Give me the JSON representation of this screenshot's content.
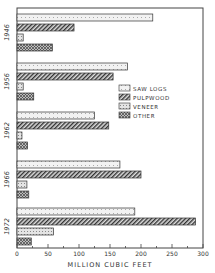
{
  "chart_data": {
    "type": "bar",
    "orientation": "horizontal",
    "title": "",
    "xlabel": "MILLION CUBIC FEET",
    "ylabel": "",
    "xlim": [
      0,
      300
    ],
    "xticks": [
      0,
      50,
      100,
      150,
      200,
      250,
      300
    ],
    "grid": false,
    "legend_position": "right-middle inside",
    "categories": [
      "1946",
      "1956",
      "1962",
      "1966",
      "1972"
    ],
    "series": [
      {
        "name": "SAW LOGS",
        "pattern": "stipple-light",
        "values": [
          219,
          178,
          125,
          166,
          190
        ]
      },
      {
        "name": "PULPWOOD",
        "pattern": "diagonal-hatch",
        "values": [
          92,
          155,
          148,
          200,
          288
        ]
      },
      {
        "name": "VENEER",
        "pattern": "stipple-medium",
        "values": [
          10,
          10,
          8,
          16,
          59
        ]
      },
      {
        "name": "OTHER",
        "pattern": "crosshatch",
        "values": [
          57,
          27,
          17,
          19,
          23
        ]
      }
    ]
  },
  "legend": {
    "items": [
      {
        "label": "SAW LOGS"
      },
      {
        "label": "PULPWOOD"
      },
      {
        "label": "VENEER"
      },
      {
        "label": "OTHER"
      }
    ]
  },
  "axis": {
    "xlabel": "MILLION CUBIC FEET",
    "ticks": [
      "0",
      "50",
      "100",
      "150",
      "200",
      "250",
      "300"
    ]
  }
}
